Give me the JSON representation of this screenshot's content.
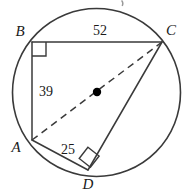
{
  "figure": {
    "name": "inscribed-quadrilateral-diagram",
    "background_color": "#ffffff",
    "stroke_color": "#3a3a3a",
    "text_color": "#1a1a1a",
    "center_dot_color": "#000000"
  },
  "circle": {
    "name": "circumscribed-circle",
    "cx": 96.5,
    "cy": 92.5,
    "r": 84,
    "stroke_width": 1.6
  },
  "center_point": {
    "name": "circle-center-dot",
    "cx": 97,
    "cy": 92,
    "r": 4.2
  },
  "vertices": [
    {
      "id": "B",
      "label": "B",
      "x": 32,
      "y": 42,
      "label_x": 20,
      "label_y": 36
    },
    {
      "id": "C",
      "label": "C",
      "x": 162,
      "y": 42,
      "label_x": 171,
      "label_y": 35
    },
    {
      "id": "A",
      "label": "A",
      "x": 32,
      "y": 140,
      "label_x": 16,
      "label_y": 152
    },
    {
      "id": "D",
      "label": "D",
      "x": 88,
      "y": 170,
      "label_x": 88,
      "label_y": 189
    }
  ],
  "segments": [
    {
      "id": "BC",
      "name": "segment-bc",
      "from": "B",
      "to": "C",
      "style": "solid",
      "x1": 32,
      "y1": 42,
      "x2": 162,
      "y2": 42
    },
    {
      "id": "BA",
      "name": "segment-ba",
      "from": "B",
      "to": "A",
      "style": "solid",
      "x1": 32,
      "y1": 42,
      "x2": 32,
      "y2": 140
    },
    {
      "id": "AD",
      "name": "segment-ad",
      "from": "A",
      "to": "D",
      "style": "solid",
      "x1": 32,
      "y1": 140,
      "x2": 88,
      "y2": 170
    },
    {
      "id": "DC",
      "name": "segment-dc",
      "from": "D",
      "to": "C",
      "style": "solid",
      "x1": 88,
      "y1": 170,
      "x2": 162,
      "y2": 42
    },
    {
      "id": "AC",
      "name": "diagonal-ac-diameter",
      "from": "A",
      "to": "C",
      "style": "dashed",
      "x1": 32,
      "y1": 140,
      "x2": 162,
      "y2": 42
    }
  ],
  "measures": [
    {
      "id": "bc-length",
      "name": "measure-label-bc",
      "value": "52",
      "segment": "BC",
      "x": 100,
      "y": 35
    },
    {
      "id": "ba-length",
      "name": "measure-label-ba",
      "value": "39",
      "segment": "BA",
      "x": 46,
      "y": 96
    },
    {
      "id": "ad-length",
      "name": "measure-label-ad",
      "value": "25",
      "segment": "AD",
      "x": 68,
      "y": 154
    }
  ],
  "right_angles": [
    {
      "id": "angle-B",
      "name": "right-angle-marker-b",
      "vertex": "B",
      "points": "46,42 46,56 32,56",
      "size": 14
    },
    {
      "id": "angle-D",
      "name": "right-angle-marker-d",
      "vertex": "D",
      "points": "79.2,158.5 87.9,147.3 99.1,156.0 90.4,167.2",
      "size": 14
    }
  ],
  "artifact": {
    "name": "cropped-text-artifact",
    "x": 122,
    "y": 2,
    "visible": true
  }
}
